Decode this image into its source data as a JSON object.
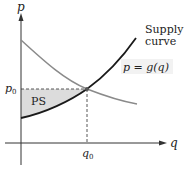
{
  "diagram": {
    "type": "supply-demand producer surplus",
    "axes": {
      "y_label": "p",
      "x_label": "q"
    },
    "labels": {
      "p0": "p",
      "p0_sub": "0",
      "q0": "q",
      "q0_sub": "0",
      "ps": "PS",
      "supply_line1": "Supply",
      "supply_line2": "curve",
      "demand_eq": "p = g(q)"
    },
    "colors": {
      "supply_curve": "#1a1a1a",
      "demand_curve": "#8a8a8a",
      "ps_fill": "#dcdcdc",
      "axes": "#333333",
      "dashed": "#444444"
    }
  }
}
